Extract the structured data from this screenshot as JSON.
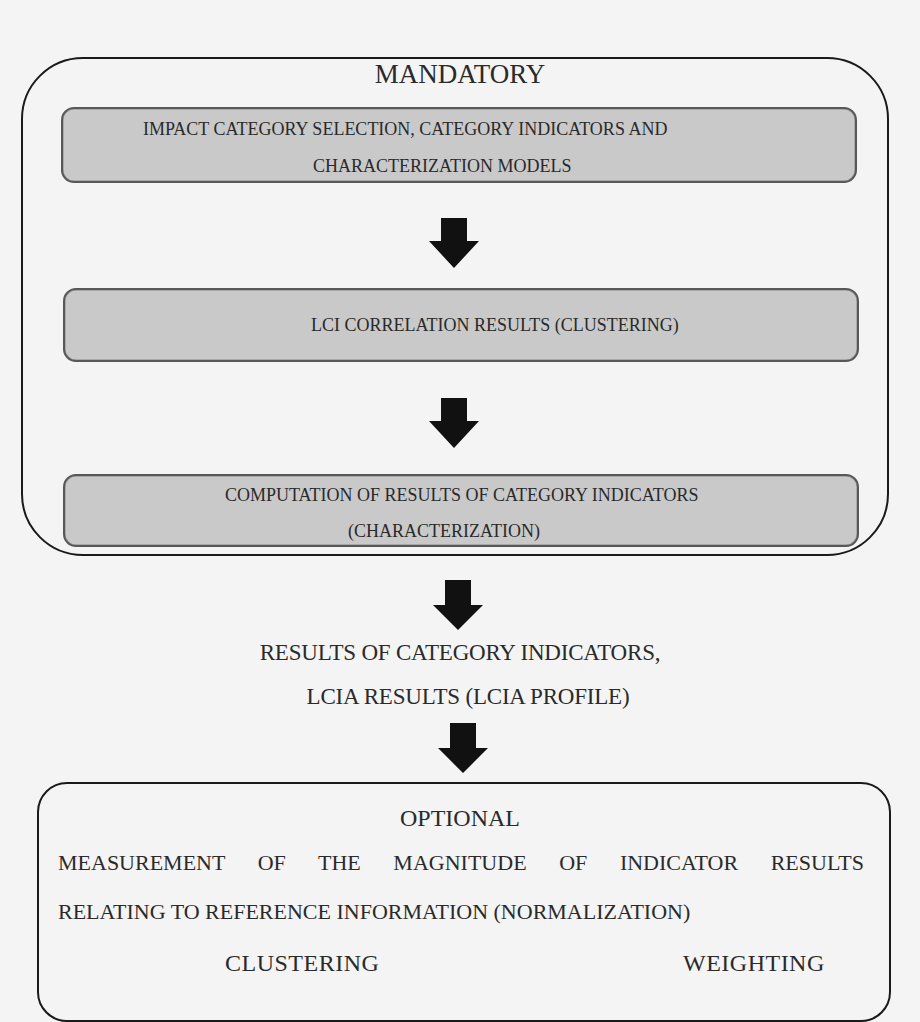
{
  "diagram": {
    "mandatory": {
      "title": "MANDATORY",
      "steps": [
        {
          "line1": "IMPACT CATEGORY SELECTION, CATEGORY INDICATORS AND",
          "line2": "CHARACTERIZATION MODELS"
        },
        {
          "line1": "LCI CORRELATION RESULTS (CLUSTERING)"
        },
        {
          "line1": "COMPUTATION OF RESULTS OF CATEGORY INDICATORS",
          "line2": "(CHARACTERIZATION)"
        }
      ]
    },
    "results": {
      "line1": "RESULTS OF CATEGORY INDICATORS,",
      "line2": "LCIA RESULTS (LCIA PROFILE)"
    },
    "optional": {
      "title": "OPTIONAL",
      "line1": "MEASUREMENT OF THE MAGNITUDE OF INDICATOR RESULTS",
      "line2": "RELATING TO REFERENCE INFORMATION (NORMALIZATION)",
      "items": [
        "CLUSTERING",
        "WEIGHTING"
      ]
    },
    "arrow_icon": "down-arrow-icon",
    "colors": {
      "step_fill": "#c9c9c9",
      "step_border": "#585858",
      "outline": "#1a1a1a",
      "arrow": "#111111",
      "background": "#f4f4f4"
    }
  }
}
